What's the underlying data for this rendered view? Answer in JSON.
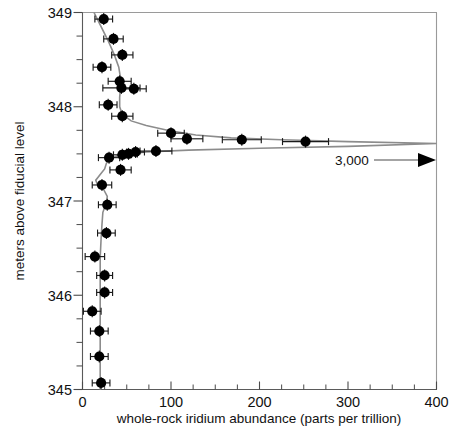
{
  "figure": {
    "background_color": "#ffffff",
    "marker_color": "#000000",
    "curve_color": "#8c8c8c",
    "axis_color": "#4a4a4a"
  },
  "annotations": [
    {
      "name": "offscale-label",
      "text": "3,000",
      "x_px": 352,
      "y_px": 160
    }
  ],
  "chart_data": {
    "type": "scatter",
    "title": "",
    "subtitle": "",
    "xlabel": "whole-rock iridium abundance (parts per trillion)",
    "ylabel": "meters above fiducial level",
    "xlim": [
      0,
      400
    ],
    "ylim": [
      345,
      349
    ],
    "grid": false,
    "legend": null,
    "x_ticks": [
      0,
      100,
      200,
      300,
      400
    ],
    "x_tick_labels": [
      "0",
      "100",
      "200",
      "300",
      "400"
    ],
    "x_minor_tick_step": 25,
    "y_ticks": [
      345,
      346,
      347,
      348,
      349
    ],
    "y_tick_labels": [
      "345",
      "346",
      "347",
      "348",
      "349"
    ],
    "y_minor_tick_step": 0.25,
    "x_units": "parts per trillion",
    "y_units": "meters",
    "series": [
      {
        "name": "whole-rock iridium abundance",
        "orientation": "x-value-vs-y-depth",
        "marker": "filled-circle",
        "error_bars": "horizontal",
        "points": [
          {
            "y": 348.93,
            "x": 24,
            "xerr": 10
          },
          {
            "y": 348.72,
            "x": 35,
            "xerr": 11
          },
          {
            "y": 348.55,
            "x": 45,
            "xerr": 12
          },
          {
            "y": 348.42,
            "x": 22,
            "xerr": 10
          },
          {
            "y": 348.27,
            "x": 42,
            "xerr": 13
          },
          {
            "y": 348.2,
            "x": 44,
            "xerr": 21
          },
          {
            "y": 348.19,
            "x": 58,
            "xerr": 14
          },
          {
            "y": 348.02,
            "x": 29,
            "xerr": 10
          },
          {
            "y": 347.9,
            "x": 45,
            "xerr": 12
          },
          {
            "y": 347.72,
            "x": 100,
            "xerr": 15
          },
          {
            "y": 347.66,
            "x": 118,
            "xerr": 18
          },
          {
            "y": 347.65,
            "x": 180,
            "xerr": 22
          },
          {
            "y": 347.63,
            "x": 252,
            "xerr": 26
          },
          {
            "y": 347.53,
            "x": 83,
            "xerr": 18
          },
          {
            "y": 347.52,
            "x": 60,
            "xerr": 10
          },
          {
            "y": 347.5,
            "x": 52,
            "xerr": 10
          },
          {
            "y": 347.49,
            "x": 45,
            "xerr": 10
          },
          {
            "y": 347.46,
            "x": 30,
            "xerr": 12
          },
          {
            "y": 347.33,
            "x": 43,
            "xerr": 12
          },
          {
            "y": 347.17,
            "x": 22,
            "xerr": 11
          },
          {
            "y": 346.96,
            "x": 28,
            "xerr": 10
          },
          {
            "y": 346.66,
            "x": 27,
            "xerr": 10
          },
          {
            "y": 346.41,
            "x": 14,
            "xerr": 11
          },
          {
            "y": 346.21,
            "x": 25,
            "xerr": 9
          },
          {
            "y": 346.03,
            "x": 25,
            "xerr": 9
          },
          {
            "y": 345.83,
            "x": 11,
            "xerr": 10
          },
          {
            "y": 345.62,
            "x": 19,
            "xerr": 10
          },
          {
            "y": 345.35,
            "x": 19,
            "xerr": 10
          },
          {
            "y": 345.07,
            "x": 21,
            "xerr": 10
          }
        ]
      }
    ],
    "fit_curve": {
      "name": "smoothed profile",
      "description": "grey smoothed spline through the iridium profile, spiking off-scale to 3,000 ppt at the fiducial boundary",
      "points": [
        {
          "y": 349.0,
          "x": 13
        },
        {
          "y": 348.85,
          "x": 21
        },
        {
          "y": 348.7,
          "x": 29
        },
        {
          "y": 348.55,
          "x": 36
        },
        {
          "y": 348.42,
          "x": 41
        },
        {
          "y": 348.3,
          "x": 43
        },
        {
          "y": 348.2,
          "x": 43
        },
        {
          "y": 348.1,
          "x": 42
        },
        {
          "y": 348.0,
          "x": 42
        },
        {
          "y": 347.92,
          "x": 45
        },
        {
          "y": 347.85,
          "x": 55
        },
        {
          "y": 347.8,
          "x": 72
        },
        {
          "y": 347.75,
          "x": 96
        },
        {
          "y": 347.7,
          "x": 128
        },
        {
          "y": 347.67,
          "x": 168
        },
        {
          "y": 347.65,
          "x": 225
        },
        {
          "y": 347.63,
          "x": 300
        },
        {
          "y": 347.61,
          "x": 400
        },
        {
          "y": 347.58,
          "x": 300
        },
        {
          "y": 347.56,
          "x": 200
        },
        {
          "y": 347.54,
          "x": 120
        },
        {
          "y": 347.52,
          "x": 72
        },
        {
          "y": 347.5,
          "x": 52
        },
        {
          "y": 347.48,
          "x": 40
        },
        {
          "y": 347.45,
          "x": 31
        },
        {
          "y": 347.4,
          "x": 27
        },
        {
          "y": 347.34,
          "x": 25
        },
        {
          "y": 347.28,
          "x": 20
        },
        {
          "y": 347.22,
          "x": 15
        },
        {
          "y": 347.17,
          "x": 17
        },
        {
          "y": 347.12,
          "x": 24
        },
        {
          "y": 347.05,
          "x": 28
        },
        {
          "y": 346.98,
          "x": 27
        },
        {
          "y": 346.88,
          "x": 23
        },
        {
          "y": 346.75,
          "x": 22
        },
        {
          "y": 346.6,
          "x": 21
        },
        {
          "y": 346.4,
          "x": 20
        },
        {
          "y": 346.2,
          "x": 20
        },
        {
          "y": 346.0,
          "x": 20
        },
        {
          "y": 345.8,
          "x": 20
        },
        {
          "y": 345.6,
          "x": 20
        },
        {
          "y": 345.4,
          "x": 20
        },
        {
          "y": 345.2,
          "x": 20
        },
        {
          "y": 345.0,
          "x": 20
        }
      ]
    }
  }
}
